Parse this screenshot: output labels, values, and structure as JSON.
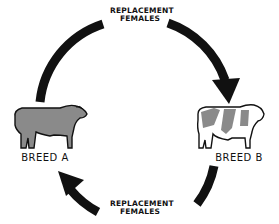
{
  "diagram": {
    "type": "crossbreeding-cycle",
    "top_label": {
      "line1": "REPLACEMENT",
      "line2": "FEMALES"
    },
    "bottom_label": {
      "line1": "REPLACEMENT",
      "line2": "FEMALES"
    },
    "nodes": [
      {
        "id": "breed-a",
        "label": "BREED A",
        "icon": "solid-dark-bull-icon"
      },
      {
        "id": "breed-b",
        "label": "BREED B",
        "icon": "spotted-bull-icon"
      }
    ],
    "edges": [
      {
        "from": "BREED A",
        "to": "BREED B",
        "label": "REPLACEMENT FEMALES",
        "direction": "clockwise-top"
      },
      {
        "from": "BREED B",
        "to": "BREED A",
        "label": "REPLACEMENT FEMALES",
        "direction": "clockwise-bottom"
      }
    ],
    "colors": {
      "arrow": "#111111",
      "bull_fill": "#8a8a8a",
      "outline": "#111111",
      "background": "#ffffff"
    }
  }
}
